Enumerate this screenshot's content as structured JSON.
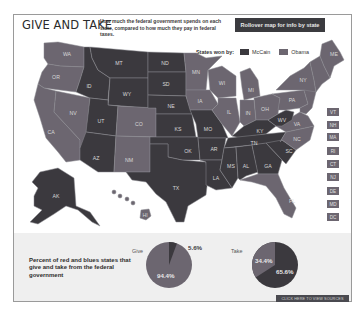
{
  "header": {
    "title": "GIVE AND TAKE",
    "subtitle": "How much the federal government spends on each state, compared to how much they pay in federal taxes.",
    "rollover_button": "Rollover map for info by state"
  },
  "legend": {
    "label": "States won by:",
    "items": [
      {
        "label": "McCain",
        "color": "#3b393e"
      },
      {
        "label": "Obama",
        "color": "#6c6670"
      }
    ]
  },
  "map": {
    "states": {
      "WA": "WA",
      "OR": "OR",
      "CA": "CA",
      "NV": "NV",
      "ID": "ID",
      "MT": "MT",
      "WY": "WY",
      "UT": "UT",
      "AZ": "AZ",
      "CO": "CO",
      "NM": "NM",
      "ND": "ND",
      "SD": "SD",
      "NE": "NE",
      "KS": "KS",
      "OK": "OK",
      "TX": "TX",
      "MN": "MN",
      "IA": "IA",
      "MO": "MO",
      "AR": "AR",
      "LA": "LA",
      "WI": "WI",
      "IL": "IL",
      "MI": "MI",
      "IN": "IN",
      "OH": "OH",
      "KY": "KY",
      "TN": "TN",
      "MS": "MS",
      "AL": "AL",
      "GA": "GA",
      "FL": "FL",
      "SC": "SC",
      "NC": "NC",
      "VA": "VA",
      "WV": "WV",
      "PA": "PA",
      "NY": "NY",
      "ME": "ME",
      "AK": "AK",
      "HI": "HI"
    },
    "small_state_buttons": [
      "VT",
      "NH",
      "MA",
      "RI",
      "CT",
      "NJ",
      "DE",
      "MD",
      "DC"
    ]
  },
  "pies": {
    "description": "Percent of red and blues states that give and take from the federal government",
    "give": {
      "label": "Give",
      "obama_pct": "94.4%",
      "mccain_pct": "5.6%"
    },
    "take": {
      "label": "Take",
      "obama_pct": "34.4%",
      "mccain_pct": "65.6%"
    }
  },
  "footer": {
    "sources_link": "CLICK HERE TO VIEW SOURCES"
  },
  "colors": {
    "mccain": "#3b393e",
    "obama": "#6c6670"
  }
}
